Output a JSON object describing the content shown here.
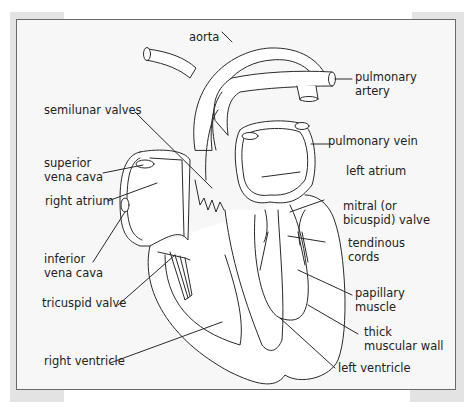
{
  "figure": {
    "labels": {
      "aorta": "aorta",
      "pulmonary_artery_1": "pulmonary",
      "pulmonary_artery_2": "artery",
      "semilunar_valves": "semilunar valves",
      "pulmonary_vein": "pulmonary vein",
      "superior_vena_cava_1": "superior",
      "superior_vena_cava_2": "vena cava",
      "left_atrium": "left atrium",
      "right_atrium": "right atrium",
      "mitral_valve_1": "mitral (or",
      "mitral_valve_2": "bicuspid) valve",
      "tendinous_cords_1": "tendinous",
      "tendinous_cords_2": "cords",
      "inferior_vena_cava_1": "inferior",
      "inferior_vena_cava_2": "vena cava",
      "tricuspid_valve": "tricuspid valve",
      "papillary_muscle_1": "papillary",
      "papillary_muscle_2": "muscle",
      "thick_muscular_wall_1": "thick",
      "thick_muscular_wall_2": "muscular wall",
      "right_ventricle": "right ventricle",
      "left_ventricle": "left ventricle"
    },
    "colors": {
      "frame_border": "#6a6a6a",
      "frame_bg": "#f7f7f7",
      "line": "#2a2a2a",
      "text": "#222222"
    }
  }
}
